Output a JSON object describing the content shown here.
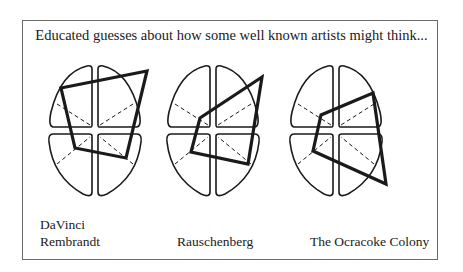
{
  "title": "Educated guesses about how some well known artists might think...",
  "labels": {
    "brain1_line1": "DaVinci",
    "brain1_line2": "Rembrandt",
    "brain2": "Rauschenberg",
    "brain3": "The Ocracoke Colony"
  },
  "brains": [
    {
      "name": "DaVinci / Rembrandt",
      "center_x": 95,
      "profile": [
        [
          65,
          87
        ],
        [
          151,
          78
        ],
        [
          129,
          140
        ],
        [
          74,
          131
        ]
      ]
    },
    {
      "name": "Rauschenberg",
      "center_x": 213,
      "profile": [
        [
          253,
          79
        ],
        [
          240,
          151
        ],
        [
          189,
          139
        ],
        [
          198,
          118
        ]
      ]
    },
    {
      "name": "The Ocracoke Colony",
      "center_x": 336,
      "profile": [
        [
          373,
          92
        ],
        [
          386,
          185
        ],
        [
          313,
          151
        ],
        [
          322,
          115
        ]
      ]
    }
  ],
  "colors": {
    "line": "#1a1a1a",
    "frame": "#6a6a6a"
  }
}
